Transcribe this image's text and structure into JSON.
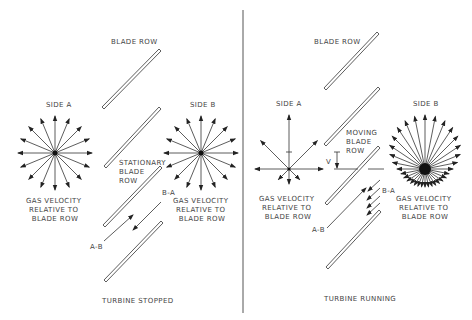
{
  "panels": {
    "left": {
      "caption": "TURBINE STOPPED",
      "blade_row_label": "BLADE ROW",
      "side_a_label": "SIDE A",
      "side_b_label": "SIDE B",
      "blade_row_name": [
        "STATIONARY",
        "BLADE",
        "ROW"
      ],
      "side_a_velocity_label": [
        "GAS VELOCITY",
        "RELATIVE TO",
        "BLADE ROW"
      ],
      "side_b_velocity_label": [
        "GAS VELOCITY",
        "RELATIVE TO",
        "BLADE ROW"
      ],
      "flow_a_to_b": "A-B",
      "flow_b_to_a": "B-A",
      "side_a_arrow_count": 16,
      "side_b_arrow_count": 16
    },
    "right": {
      "caption": "TURBINE RUNNING",
      "blade_row_label": "BLADE ROW",
      "side_a_label": "SIDE A",
      "side_b_label": "SIDE B",
      "blade_row_name": [
        "MOVING",
        "BLADE",
        "ROW"
      ],
      "velocity_symbol": "V",
      "side_a_velocity_label": [
        "GAS VELOCITY",
        "RELATIVE TO",
        "BLADE ROW"
      ],
      "side_b_velocity_label": [
        "GAS VELOCITY",
        "RELATIVE TO",
        "BLADE ROW"
      ],
      "flow_a_to_b": "A-B",
      "flow_b_to_a": "B-A",
      "side_a_arrow_count": 8,
      "side_b_arrow_count": 32
    }
  }
}
